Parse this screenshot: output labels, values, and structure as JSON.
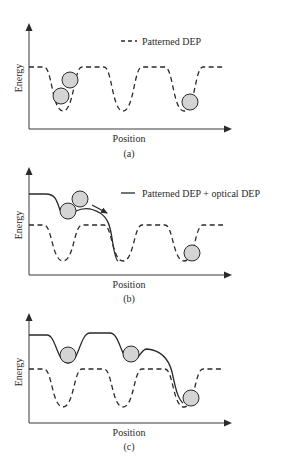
{
  "figure": {
    "panels": [
      {
        "id": "a",
        "caption": "(a)",
        "xlabel": "Position",
        "ylabel": "Energy",
        "legend": {
          "style": "dashed",
          "label": "Patterned DEP"
        },
        "curves": [
          "Patterned DEP (dashed)"
        ],
        "particles": 3
      },
      {
        "id": "b",
        "caption": "(b)",
        "xlabel": "Position",
        "ylabel": "Energy",
        "legend": {
          "style": "solid",
          "label": "Patterned DEP + optical DEP"
        },
        "curves": [
          "Patterned DEP (dashed)",
          "Patterned DEP + optical DEP (solid)"
        ],
        "particles": 3,
        "annotation": "arrow indicating particle motion"
      },
      {
        "id": "c",
        "caption": "(c)",
        "xlabel": "Position",
        "ylabel": "Energy",
        "curves": [
          "Patterned DEP (dashed)",
          "Patterned DEP + optical DEP (solid)"
        ],
        "particles": 3
      }
    ],
    "colors": {
      "line": "#2a2a2a",
      "particle_fill": "#d4d4d4",
      "background": "#ffffff"
    }
  }
}
